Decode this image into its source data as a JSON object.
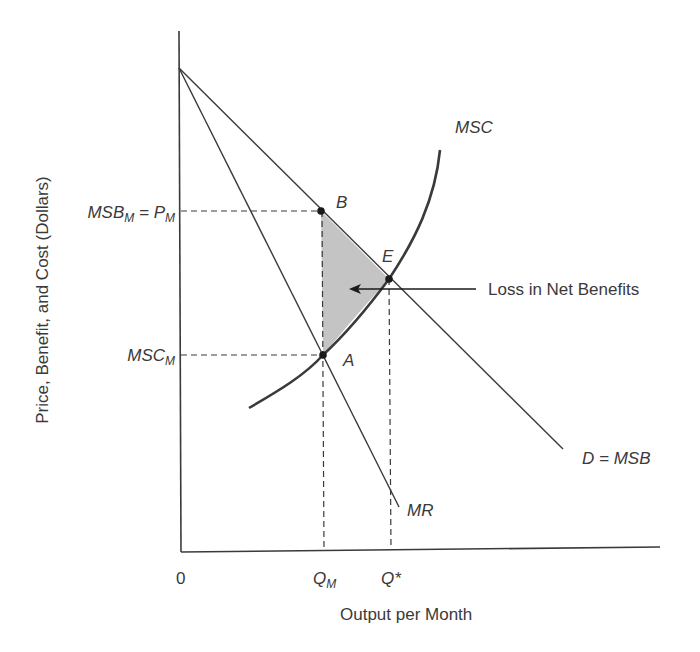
{
  "diagram": {
    "type": "economics-monopoly-deadweight-loss",
    "axes": {
      "y_label": "Price, Benefit, and Cost (Dollars)",
      "x_label": "Output per Month",
      "origin_label": "0"
    },
    "x_ticks": {
      "q_m": {
        "main": "Q",
        "sub": "M"
      },
      "q_star": {
        "main": "Q*"
      }
    },
    "y_ticks": {
      "msb_m_equals_p_m": {
        "part1": "MSB",
        "sub1": "M",
        "eq": " = P",
        "sub2": "M"
      },
      "msc_m": {
        "main": "MSC",
        "sub": "M"
      }
    },
    "curves": {
      "msc": "MSC",
      "demand": "D = MSB",
      "mr": "MR"
    },
    "points": {
      "b": "B",
      "e": "E",
      "a": "A"
    },
    "annotation": {
      "loss": "Loss in Net Benefits"
    },
    "colors": {
      "line": "#3a3a3a",
      "shade": "#c4c4c4",
      "text": "#3a3a3a"
    }
  }
}
